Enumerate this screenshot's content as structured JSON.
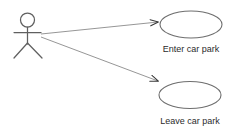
{
  "diagram": {
    "kind": "uml-use-case-diagram",
    "canvas": {
      "width": 234,
      "height": 132,
      "background": "#ffffff"
    },
    "stroke_color": "#555555",
    "text_color": "#2b2b2b",
    "actor": {
      "name": "",
      "head": {
        "cx": 27.5,
        "cy": 20,
        "r": 7
      },
      "spine": {
        "x": 27.5,
        "y1": 27,
        "y2": 44
      },
      "arms": {
        "x1": 14,
        "x2": 41,
        "y": 32.5
      },
      "leg_left": {
        "x1": 27.5,
        "y1": 43,
        "x2": 14,
        "y2": 58
      },
      "leg_right": {
        "x1": 27.5,
        "y1": 43,
        "x2": 42,
        "y2": 58
      }
    },
    "use_cases": [
      {
        "id": "enter-car-park",
        "label": "Enter car park",
        "ellipse": {
          "cx": 191,
          "cy": 24.5,
          "rx": 31,
          "ry": 13.5
        },
        "label_pos": {
          "x": 191,
          "y": 52
        }
      },
      {
        "id": "leave-car-park",
        "label": "Leave car park",
        "ellipse": {
          "cx": 190,
          "cy": 95,
          "rx": 31,
          "ry": 13.5
        },
        "label_pos": {
          "x": 190,
          "y": 124
        }
      }
    ],
    "associations": [
      {
        "id": "actor-to-enter-car-park",
        "from": "actor",
        "to": "enter-car-park",
        "x1": 41,
        "y1": 34,
        "x2": 158,
        "y2": 22
      },
      {
        "id": "actor-to-leave-car-park",
        "from": "actor",
        "to": "leave-car-park",
        "x1": 41,
        "y1": 37,
        "x2": 158,
        "y2": 81
      }
    ]
  }
}
